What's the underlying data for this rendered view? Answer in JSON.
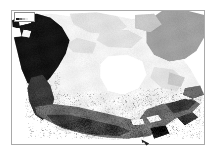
{
  "figure": {
    "name": "canada-grayscale-raster-map",
    "width": 217,
    "height": 155,
    "background_color": "#ffffff",
    "frame": {
      "visible": true,
      "color": "#a9a9a9",
      "left": 11,
      "top": 10,
      "width": 194,
      "height": 135
    }
  },
  "legend": {
    "visible": true,
    "label": "",
    "note": "tiny unreadable label box in upper-left corner of map frame",
    "swatch_colors": [
      "#1c1c1c",
      "#6e6e6e",
      "#b4b4b4",
      "#e8e8e8"
    ]
  },
  "map": {
    "region": "Canada and northern North America",
    "projection_hint": "conic",
    "rendering": "grayscale raster / continuous shading",
    "palette": {
      "background_ocean": "#ffffff",
      "very_light": "#f2f2f2",
      "light": "#e0e0e0",
      "mid_light": "#c8c8c8",
      "mid": "#a0a0a0",
      "mid_dark": "#6b6b6b",
      "dark": "#3a3a3a",
      "darkest": "#151515"
    },
    "features": [
      {
        "name": "alaska-yukon-dark-mass",
        "tone": "darkest",
        "position": "northwest"
      },
      {
        "name": "greenland-gray-mass",
        "tone": "mid",
        "position": "northeast"
      },
      {
        "name": "arctic-archipelago",
        "tone": "very_light",
        "position": "north-central"
      },
      {
        "name": "hudson-bay",
        "tone": "background_ocean",
        "position": "center-east"
      },
      {
        "name": "central-plains",
        "tone": "very_light",
        "position": "center-south"
      },
      {
        "name": "southern-border-band",
        "tone": "mid_dark",
        "position": "south"
      },
      {
        "name": "pacific-coast-range",
        "tone": "dark",
        "position": "southwest"
      },
      {
        "name": "great-lakes-st-lawrence",
        "tone": "mid_dark",
        "position": "southeast"
      },
      {
        "name": "atlantic-maritimes",
        "tone": "dark",
        "position": "east"
      }
    ]
  },
  "chart_data": {
    "type": "heatmap",
    "title": "",
    "xlabel": "",
    "ylabel": "",
    "grid": false,
    "legend_position": "top-left",
    "colorscale": [
      "#ffffff",
      "#e8e8e8",
      "#c8c8c8",
      "#9a9a9a",
      "#5a5a5a",
      "#151515"
    ],
    "value_range": [
      0,
      1
    ]
  }
}
